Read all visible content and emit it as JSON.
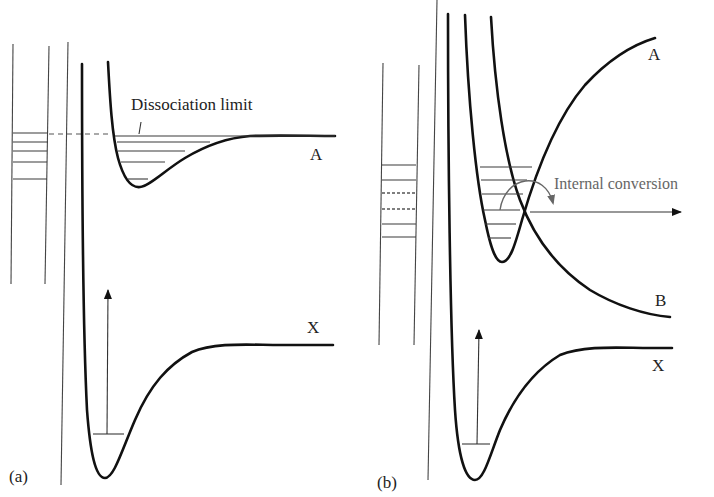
{
  "figure": {
    "panel_a": {
      "label": "(a)",
      "curves": [
        {
          "name": "A",
          "label": "A",
          "description": "excited state potential curve, shallow well leading to dissociation"
        },
        {
          "name": "X",
          "label": "X",
          "description": "ground state potential curve"
        }
      ],
      "annotation": "Dissociation limit",
      "vibrational_levels_A": 5,
      "level_ladder_rungs": 5
    },
    "panel_b": {
      "label": "(b)",
      "curves": [
        {
          "name": "A",
          "label": "A",
          "description": "bound excited state"
        },
        {
          "name": "B",
          "label": "B",
          "description": "repulsive state crossing A"
        },
        {
          "name": "X",
          "label": "X",
          "description": "ground state potential curve"
        }
      ],
      "annotation": "Internal conversion",
      "vibrational_levels_A": 7,
      "level_ladder_rungs": 6,
      "ladder_dashed_rungs": [
        3,
        4
      ]
    }
  }
}
